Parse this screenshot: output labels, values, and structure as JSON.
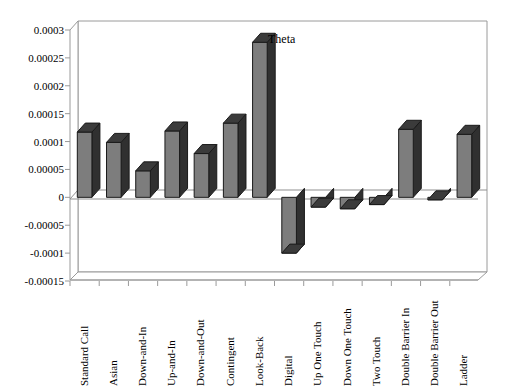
{
  "chart_data": {
    "type": "bar",
    "title": "",
    "subtitle": "",
    "annotation": "Theta",
    "xlabel": "",
    "ylabel": "",
    "grid": false,
    "legend_position": "inside-top-right",
    "style": "3d-column",
    "ylim": [
      -0.00015,
      0.0003
    ],
    "ytick_labels": [
      "0.0003",
      "0.00025",
      "0.0002",
      "0.00015",
      "0.0001",
      "0.00005",
      "0",
      "-0.00005",
      "-0.0001",
      "-0.00015"
    ],
    "ytick_values": [
      0.0003,
      0.00025,
      0.0002,
      0.00015,
      0.0001,
      5e-05,
      0,
      -5e-05,
      -0.0001,
      -0.00015
    ],
    "categories": [
      "Standard Call",
      "Asian",
      "Down-and-In",
      "Up-and-In",
      "Down-and-Out",
      "Contingent",
      "Look-Back",
      "Digital",
      "Up One Touch",
      "Down One Touch",
      "Two Touch",
      "Double Barrier In",
      "Double Barrier Out",
      "Ladder"
    ],
    "values": [
      0.000117,
      9.85e-05,
      4.75e-05,
      0.000119,
      7.85e-05,
      0.000133,
      0.000278,
      -0.0001,
      -1.75e-05,
      -2.05e-05,
      -1.3e-05,
      0.000122,
      -4.5e-06,
      0.000113
    ],
    "series": [
      {
        "name": "Theta",
        "values": [
          0.000117,
          9.85e-05,
          4.75e-05,
          0.000119,
          7.85e-05,
          0.000133,
          0.000278,
          -0.0001,
          -1.75e-05,
          -2.05e-05,
          -1.3e-05,
          0.000122,
          -4.5e-06,
          0.000113
        ]
      }
    ],
    "colors": {
      "bar_front": "#7d7d7d",
      "bar_top": "#3b3b3b",
      "bar_side": "#303030",
      "bar_outline": "#1a1a1a",
      "axis": "#9a9a9a",
      "floor": "#ffffff",
      "background": "#ffffff",
      "text": "#000000"
    }
  }
}
